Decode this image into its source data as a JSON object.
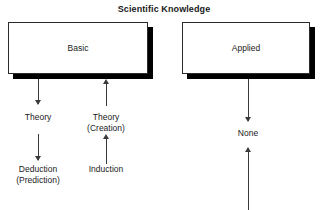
{
  "diagram": {
    "title": "Scientific Knowledge",
    "nodes": [
      {
        "id": "basic",
        "label": "Basic"
      },
      {
        "id": "applied",
        "label": "Applied"
      }
    ],
    "edge_labels": {
      "theory": "Theory",
      "theory_creation_line1": "Theory",
      "theory_creation_line2": "(Creation)",
      "deduction_line1": "Deduction",
      "deduction_line2": "(Prediction)",
      "induction": "Induction",
      "none": "None"
    },
    "colors": {
      "background": "#ffffff",
      "box_border": "#2b2b2b",
      "box_shadow": "#000000",
      "arrow": "#3a3a3a",
      "text": "#1a1a1a"
    },
    "connectors": [
      {
        "from": "basic",
        "to": "theory",
        "direction": "down"
      },
      {
        "from": "theory",
        "to": "deduction",
        "direction": "down"
      },
      {
        "from": "induction",
        "to": "theory_creation",
        "direction": "up"
      },
      {
        "from": "theory_creation",
        "to": "basic",
        "direction": "up"
      },
      {
        "from": "applied",
        "to": "none",
        "direction": "down"
      },
      {
        "from": "below",
        "to": "none",
        "direction": "up"
      }
    ]
  }
}
